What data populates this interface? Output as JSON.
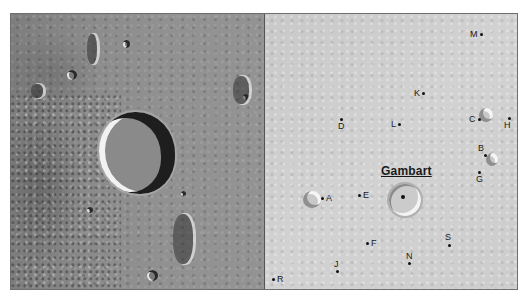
{
  "map": {
    "title": "Gambart",
    "panels": {
      "left": {
        "type": "photographic-view"
      },
      "right": {
        "type": "labeled-chart"
      }
    },
    "satellite_craters": [
      {
        "label": "A",
        "x": 66,
        "y": 184,
        "label_side": "right"
      },
      {
        "label": "B",
        "x": 222,
        "y": 142,
        "label_side": "above-left"
      },
      {
        "label": "C",
        "x": 213,
        "y": 106,
        "label_side": "left"
      },
      {
        "label": "D",
        "x": 76,
        "y": 106,
        "label_side": "below"
      },
      {
        "label": "E",
        "x": 94,
        "y": 180,
        "label_side": "right"
      },
      {
        "label": "F",
        "x": 102,
        "y": 229,
        "label_side": "right"
      },
      {
        "label": "G",
        "x": 214,
        "y": 163,
        "label_side": "below"
      },
      {
        "label": "H",
        "x": 243,
        "y": 105,
        "label_side": "below-left"
      },
      {
        "label": "J",
        "x": 71,
        "y": 257,
        "label_side": "above-right"
      },
      {
        "label": "K",
        "x": 159,
        "y": 80,
        "label_side": "left"
      },
      {
        "label": "L",
        "x": 134,
        "y": 109,
        "label_side": "left"
      },
      {
        "label": "M",
        "x": 218,
        "y": 20,
        "label_side": "left"
      },
      {
        "label": "N",
        "x": 145,
        "y": 250,
        "label_side": "above"
      },
      {
        "label": "R",
        "x": 9,
        "y": 265,
        "label_side": "right"
      },
      {
        "label": "S",
        "x": 185,
        "y": 232,
        "label_side": "above-left"
      }
    ]
  }
}
